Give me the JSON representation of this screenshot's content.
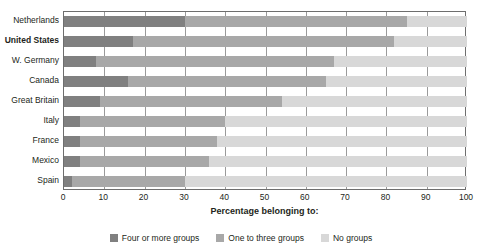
{
  "chart_data": {
    "type": "bar",
    "orientation": "horizontal",
    "stacked": true,
    "stack_total": 100,
    "title": "",
    "xlabel": "Percentage belonging to:",
    "ylabel": "",
    "xlim": [
      0,
      100
    ],
    "xticks": [
      "0",
      "10",
      "20",
      "30",
      "40",
      "50",
      "60",
      "70",
      "80",
      "90",
      "100"
    ],
    "grid": true,
    "grid_axis": "x",
    "legend_position": "bottom",
    "categories": [
      "Netherlands",
      "United States",
      "W. Germany",
      "Canada",
      "Great Britain",
      "Italy",
      "France",
      "Mexico",
      "Spain"
    ],
    "highlighted_category": "United States",
    "series": [
      {
        "name": "Four or more groups",
        "color": "#808080",
        "values": [
          30,
          17,
          8,
          16,
          9,
          4,
          4,
          4,
          2
        ]
      },
      {
        "name": "One to three groups",
        "color": "#a8a8a8",
        "values": [
          55,
          65,
          59,
          49,
          45,
          36,
          34,
          32,
          28
        ]
      },
      {
        "name": "No groups",
        "color": "#d8d8d8",
        "values": [
          15,
          18,
          33,
          35,
          46,
          60,
          62,
          64,
          70
        ]
      }
    ],
    "cumulative_edges": [
      [
        30,
        85
      ],
      [
        17,
        82
      ],
      [
        8,
        67
      ],
      [
        16,
        65
      ],
      [
        9,
        54
      ],
      [
        4,
        40
      ],
      [
        4,
        38
      ],
      [
        4,
        36
      ],
      [
        2,
        30
      ]
    ]
  },
  "axis_title": "Percentage belonging to:",
  "legend": {
    "items": [
      {
        "label": "Four or more groups",
        "color": "#808080"
      },
      {
        "label": "One to three groups",
        "color": "#a8a8a8"
      },
      {
        "label": "No groups",
        "color": "#d8d8d8"
      }
    ]
  },
  "colors": {
    "frame": "#6e6e6e",
    "gridline": "#9a9a9a",
    "text": "#231f20",
    "background": "#ffffff"
  }
}
